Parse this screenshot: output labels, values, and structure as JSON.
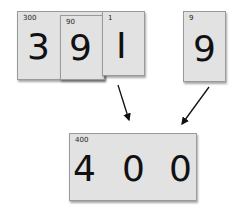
{
  "top_cards": {
    "hundreds": {
      "small": "300",
      "big": "3"
    },
    "tens": {
      "small": "90",
      "big": "9"
    },
    "ones": {
      "small": "1",
      "big": "I"
    }
  },
  "single_card": {
    "small": "9",
    "big": "9"
  },
  "result_card": {
    "small": "400",
    "digits": [
      "4",
      "0",
      "0"
    ]
  },
  "colors": {
    "card_fill": "#e2e2e2",
    "card_border": "#9a9a9a",
    "text": "#111111"
  }
}
